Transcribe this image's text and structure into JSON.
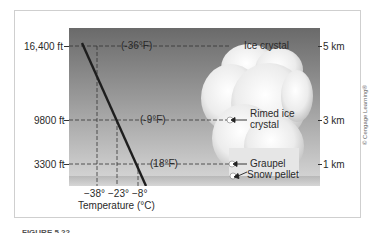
{
  "figure": {
    "left_axis": {
      "ticks": [
        "16,400 ft",
        "9800 ft",
        "3300 ft"
      ]
    },
    "right_axis": {
      "ticks": [
        "5 km",
        "3 km",
        "1 km"
      ]
    },
    "x_axis": {
      "ticks": [
        "−38°",
        "−23°",
        "−8°"
      ],
      "label": "Temperature (°C)"
    },
    "fahrenheit_labels": [
      "(-36°F)",
      "(-9°F)",
      "(18°F)"
    ],
    "particle_labels": {
      "ice_crystal": "Ice crystal",
      "rimed_ice_1": "Rimed ice",
      "rimed_ice_2": "crystal",
      "graupel": "Graupel",
      "snow_pellet": "Snow pellet"
    },
    "copyright": "© Cengage Learning®",
    "caption": "FIGURE 5.22 ..."
  },
  "colors": {
    "sky_top": "#6a6a6a",
    "sky_bottom": "#d9d9d9",
    "line": "#1e1e1e",
    "cloud": "#f2f2f2"
  }
}
